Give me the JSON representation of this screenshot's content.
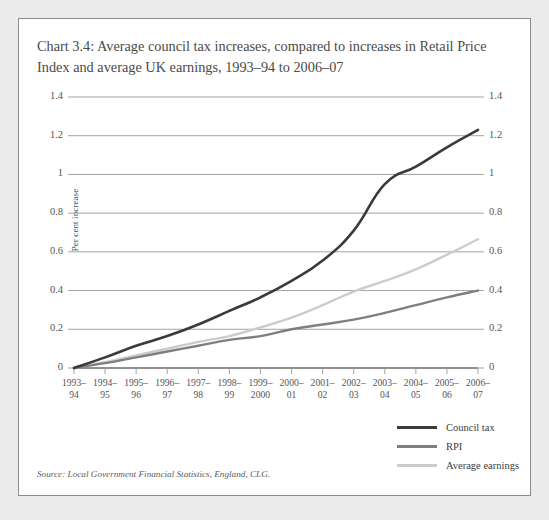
{
  "chart_title": "Chart 3.4: Average council tax increases, compared to increases in Retail Price Index and average UK earnings, 1993–94 to 2006–07",
  "source_note": "Source: Local Government Financial Statistics, England, CLG.",
  "colors": {
    "council_tax": "#3a3a3a",
    "rpi": "#7f7f7f",
    "average_earnings": "#cccccc",
    "gridline": "#999999",
    "axis": "#6e6e6e",
    "panel_border": "#8c8c8c",
    "page_background": "#ebebeb",
    "panel_background": "#ffffff",
    "text": "#4a4a4a"
  },
  "legend": {
    "position": "bottom-right",
    "items": [
      {
        "label": "Council tax",
        "color": "#3a3a3a"
      },
      {
        "label": "RPI",
        "color": "#7f7f7f"
      },
      {
        "label": "Average earnings",
        "color": "#cccccc"
      }
    ]
  },
  "chart_data": {
    "type": "line",
    "title": "Chart 3.4: Average council tax increases, compared to increases in Retail Price Index and average UK earnings, 1993–94 to 2006–07",
    "xlabel": "",
    "ylabel": "Per cent increase",
    "categories": [
      "1993–94",
      "1994–95",
      "1995–96",
      "1996–97",
      "1997–98",
      "1998–99",
      "1999–2000",
      "2000–01",
      "2001–02",
      "2002–03",
      "2003–04",
      "2004–05",
      "2005–06",
      "2006–07"
    ],
    "x_tick_lines": [
      [
        "1993–",
        "94"
      ],
      [
        "1994–",
        "95"
      ],
      [
        "1995–",
        "96"
      ],
      [
        "1996–",
        "97"
      ],
      [
        "1997–",
        "98"
      ],
      [
        "1998–",
        "99"
      ],
      [
        "1999–",
        "2000"
      ],
      [
        "2000–",
        "01"
      ],
      [
        "2001–",
        "02"
      ],
      [
        "2002–",
        "03"
      ],
      [
        "2003–",
        "04"
      ],
      [
        "2004–",
        "05"
      ],
      [
        "2005–",
        "06"
      ],
      [
        "2006–",
        "07"
      ]
    ],
    "ylim": [
      0,
      1.4
    ],
    "yticks": [
      0,
      0.2,
      0.4,
      0.6,
      0.8,
      1.0,
      1.2,
      1.4
    ],
    "ytick_labels": [
      "0",
      "0.2",
      "0.4",
      "0.6",
      "0.8",
      "1",
      "1.2",
      "1.4"
    ],
    "grid": true,
    "dual_y_axis": true,
    "legend_position": "bottom-right",
    "series": [
      {
        "name": "Council tax",
        "color": "#3a3a3a",
        "values": [
          0,
          0.055,
          0.115,
          0.165,
          0.225,
          0.295,
          0.365,
          0.45,
          0.555,
          0.71,
          0.95,
          1.04,
          1.14,
          1.23
        ]
      },
      {
        "name": "RPI",
        "color": "#7f7f7f",
        "values": [
          0,
          0.025,
          0.055,
          0.085,
          0.115,
          0.145,
          0.165,
          0.2,
          0.225,
          0.25,
          0.285,
          0.325,
          0.365,
          0.4
        ]
      },
      {
        "name": "Average earnings",
        "color": "#cccccc",
        "values": [
          0,
          0.03,
          0.065,
          0.1,
          0.135,
          0.165,
          0.21,
          0.26,
          0.325,
          0.395,
          0.45,
          0.51,
          0.585,
          0.665
        ]
      }
    ]
  },
  "geometry": {
    "plot_left": 55,
    "plot_right": 459,
    "plot_top": 78,
    "plot_bottom": 349
  }
}
